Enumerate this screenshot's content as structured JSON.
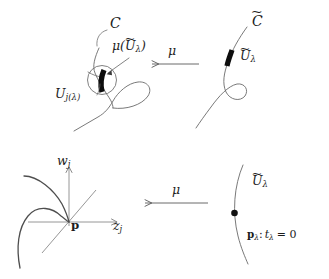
{
  "figure": {
    "background_color": "#ffffff",
    "ink_color": "#5a5a5a",
    "label_color": "#1c1c1c",
    "accent_color": "#111111",
    "panels": {
      "top_left": {
        "name": "nodal-curve-panel",
        "curve_label": "C",
        "neighborhood_label_base": "U",
        "neighborhood_label_sub": "j(λ)",
        "image_label_open": "μ(",
        "image_label_base": "U",
        "image_label_sub": "λ",
        "image_label_close": ")"
      },
      "top_right": {
        "name": "smooth-curve-panel",
        "curve_label": "C",
        "segment_label_base": "U",
        "segment_label_sub": "λ"
      },
      "bottom_left": {
        "name": "local-coordinates-panel",
        "y_axis_label_base": "w",
        "y_axis_label_sub": "j",
        "x_axis_label_base": "z",
        "x_axis_label_sub": "j",
        "origin_label": "p"
      },
      "bottom_right": {
        "name": "disc-panel",
        "arc_label_base": "U",
        "arc_label_sub": "λ",
        "point_label_p": "p",
        "point_label_p_sub": "λ",
        "point_label_sep": ":",
        "point_label_t": "t",
        "point_label_t_sub": "λ",
        "point_label_eq": "= 0"
      }
    },
    "arrows": {
      "top": {
        "name": "map-arrow-top",
        "label": "μ",
        "direction": "left"
      },
      "bottom": {
        "name": "map-arrow-bottom",
        "label": "μ",
        "direction": "left"
      }
    }
  }
}
